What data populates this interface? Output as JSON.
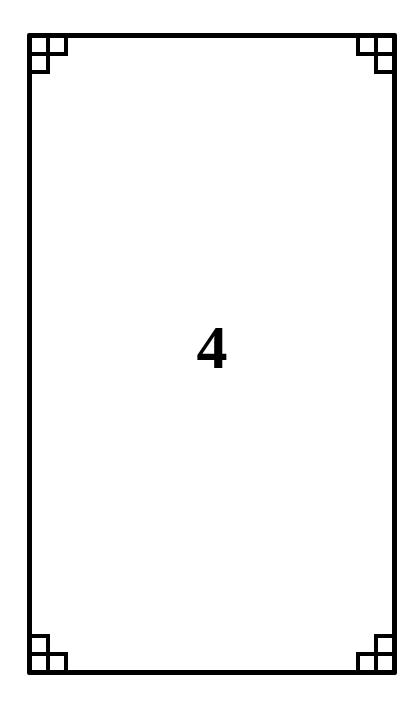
{
  "card": {
    "value": "4",
    "border_color": "#000000",
    "background": "#ffffff",
    "corner_ornaments": [
      "top-left",
      "top-right",
      "bottom-left",
      "bottom-right"
    ]
  }
}
